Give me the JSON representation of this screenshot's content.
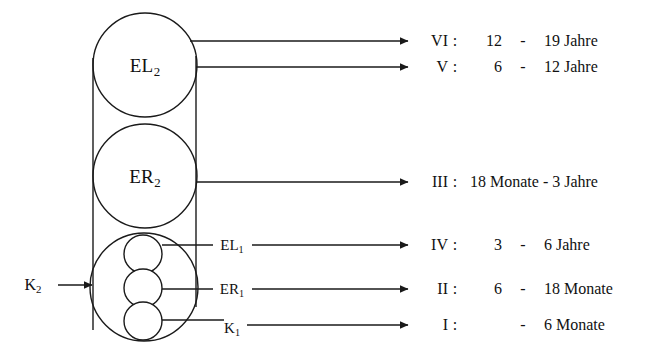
{
  "diagram": {
    "outer_circles": [
      {
        "id": "el2",
        "label_main": "EL",
        "label_sub": "2",
        "cx": 145,
        "cy": 65,
        "r": 52
      },
      {
        "id": "er2",
        "label_main": "ER",
        "label_sub": "2",
        "cx": 145,
        "cy": 176,
        "r": 52
      },
      {
        "id": "k2-outer",
        "label_main": "",
        "label_sub": "",
        "cx": 144,
        "cy": 287,
        "r": 54
      }
    ],
    "inner_circles": [
      {
        "id": "el1",
        "cx": 143,
        "cy": 254,
        "r": 19
      },
      {
        "id": "er1",
        "cx": 143,
        "cy": 288,
        "r": 19
      },
      {
        "id": "k1",
        "cx": 143,
        "cy": 321,
        "r": 19
      }
    ],
    "input": {
      "label_main": "K",
      "label_sub": "2",
      "label_x": 33,
      "label_y": 285,
      "arrow_from_x": 58,
      "arrow_to_x": 92,
      "arrow_y": 285
    },
    "inline_labels": [
      {
        "id": "el1-label",
        "main": "EL",
        "sub": "1",
        "x": 232,
        "y": 245
      },
      {
        "id": "er1-label",
        "main": "ER",
        "sub": "1",
        "x": 232,
        "y": 289
      },
      {
        "id": "k1-label",
        "main": "K",
        "sub": "1",
        "x": 232,
        "y": 328
      }
    ],
    "colors": {
      "stroke": "#1a1a1a",
      "text": "#111111",
      "background": "#ffffff"
    }
  },
  "stages": [
    {
      "roman": "VI",
      "colon": ":",
      "from": "12",
      "dash": "-",
      "to": "19 Jahre",
      "arrow_y": 41,
      "wide": false
    },
    {
      "roman": "V",
      "colon": ":",
      "from": "6",
      "dash": "-",
      "to": "12 Jahre",
      "arrow_y": 67,
      "wide": false
    },
    {
      "roman": "III",
      "colon": ":",
      "from": "18 Monate",
      "dash": "-",
      "to": "3 Jahre",
      "arrow_y": 182,
      "wide": true
    },
    {
      "roman": "IV",
      "colon": ":",
      "from": "3",
      "dash": "-",
      "to": "6 Jahre",
      "arrow_y": 245,
      "wide": false
    },
    {
      "roman": "II",
      "colon": ":",
      "from": "6",
      "dash": "-",
      "to": "18 Monate",
      "arrow_y": 289,
      "wide": false
    },
    {
      "roman": "I",
      "colon": ":",
      "from": "",
      "dash": "-",
      "to": "6 Monate",
      "arrow_y": 325,
      "wide": false
    }
  ]
}
